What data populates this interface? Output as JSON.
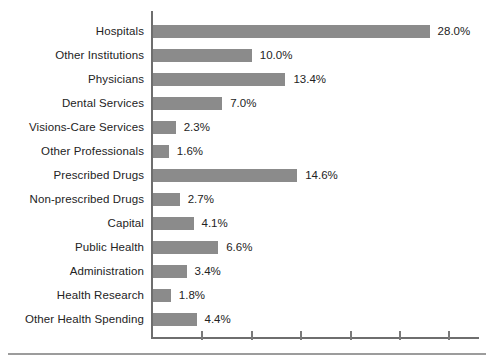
{
  "chart_data": {
    "type": "bar",
    "orientation": "horizontal",
    "title": "",
    "xlabel": "",
    "ylabel": "",
    "categories": [
      "Hospitals",
      "Other Institutions",
      "Physicians",
      "Dental Services",
      "Visions-Care Services",
      "Other Professionals",
      "Prescribed Drugs",
      "Non-prescribed Drugs",
      "Capital",
      "Public Health",
      "Administration",
      "Health Research",
      "Other Health Spending"
    ],
    "values": [
      28.0,
      10.0,
      13.4,
      7.0,
      2.3,
      1.6,
      14.6,
      2.7,
      4.1,
      6.6,
      3.4,
      1.8,
      4.4
    ],
    "data_labels": [
      "28.0%",
      "10.0%",
      "13.4%",
      "7.0%",
      "2.3%",
      "1.6%",
      "14.6%",
      "2.7%",
      "4.1%",
      "6.6%",
      "3.4%",
      "1.8%",
      "4.4%"
    ],
    "xlim": [
      0,
      33
    ],
    "x_ticks": [
      5,
      10,
      15,
      20,
      25,
      30
    ],
    "x_tick_labels_visible": false,
    "grid": false,
    "legend": false,
    "bar_color": "#8b8b8b",
    "axis_color": "#6e6e6e"
  }
}
